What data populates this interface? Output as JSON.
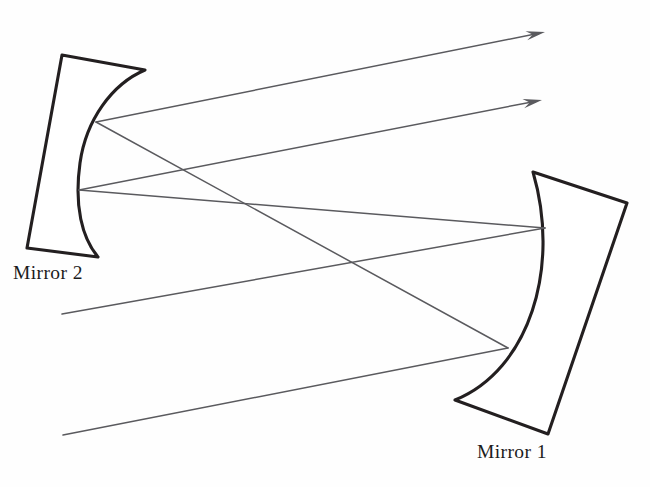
{
  "diagram": {
    "type": "optical-ray-diagram",
    "background_color": "#fefefe",
    "mirror_stroke_color": "#231f20",
    "ray_color": "#5a5a5e",
    "labels": {
      "mirror_1": "Mirror 1",
      "mirror_2": "Mirror 2"
    },
    "mirrors": [
      {
        "id": "mirror-2",
        "name": "Mirror 2",
        "side": "left",
        "concave_facing": "right",
        "outline_path": "M 62 55 L 145 70 C 112 84 86 120 80 163 C 74 206 82 238 98 257 L 27 248 Z",
        "vertices": [
          {
            "id": "m2-upper-vertex",
            "x": 96,
            "y": 122
          },
          {
            "id": "m2-lower-vertex",
            "x": 79,
            "y": 190
          }
        ]
      },
      {
        "id": "mirror-1",
        "name": "Mirror 1",
        "side": "right",
        "concave_facing": "left",
        "outline_path": "M 533 172 L 627 203 L 548 434 L 455 400 C 529 370 561 268 533 172 Z",
        "vertices": [
          {
            "id": "m1-upper-vertex",
            "x": 545,
            "y": 228
          },
          {
            "id": "m1-lower-vertex",
            "x": 508,
            "y": 348
          }
        ]
      }
    ],
    "rays": [
      {
        "id": "ray-input-upper",
        "role": "incoming beam, lower-left to Mirror 1 upper vertex",
        "from": {
          "x": 62,
          "y": 314
        },
        "to": {
          "x": 545,
          "y": 228
        },
        "arrowhead": false
      },
      {
        "id": "ray-input-lower",
        "role": "incoming beam, lower-left to Mirror 1 lower vertex",
        "from": {
          "x": 63,
          "y": 435
        },
        "to": {
          "x": 508,
          "y": 348
        },
        "arrowhead": false
      },
      {
        "id": "ray-m1-upper-to-m2-lower",
        "role": "reflection from Mirror 1 upper vertex to Mirror 2 lower vertex",
        "from": {
          "x": 545,
          "y": 228
        },
        "to": {
          "x": 79,
          "y": 190
        },
        "arrowhead": false
      },
      {
        "id": "ray-m1-lower-to-m2-upper",
        "role": "reflection from Mirror 1 lower vertex to Mirror 2 upper vertex",
        "from": {
          "x": 508,
          "y": 348
        },
        "to": {
          "x": 96,
          "y": 122
        },
        "arrowhead": false
      },
      {
        "id": "ray-output-upper",
        "role": "output beam leaving Mirror 2 upper vertex toward upper right",
        "from": {
          "x": 96,
          "y": 122
        },
        "to": {
          "x": 545,
          "y": 32
        },
        "arrowhead": true
      },
      {
        "id": "ray-output-lower",
        "role": "output beam leaving Mirror 2 lower vertex toward upper right",
        "from": {
          "x": 79,
          "y": 190
        },
        "to": {
          "x": 542,
          "y": 100
        },
        "arrowhead": true
      }
    ]
  }
}
